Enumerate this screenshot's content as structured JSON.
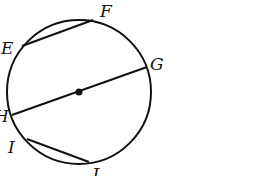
{
  "diagram": {
    "type": "circle-chords",
    "center": {
      "x": 79,
      "y": 92,
      "label": ""
    },
    "radius": 72,
    "stroke_color": "#111111",
    "points": {
      "E": {
        "x": 22,
        "y": 46
      },
      "F": {
        "x": 93,
        "y": 20
      },
      "G": {
        "x": 147,
        "y": 67
      },
      "H": {
        "x": 12,
        "y": 115
      },
      "I": {
        "x": 27,
        "y": 139
      },
      "J": {
        "x": 89,
        "y": 162
      }
    },
    "labels": {
      "E": "E",
      "F": "F",
      "G": "G",
      "H": "H",
      "I": "I",
      "J": "J"
    },
    "segments": [
      {
        "from": "E",
        "to": "F",
        "kind": "chord"
      },
      {
        "from": "H",
        "to": "G",
        "kind": "diameter"
      },
      {
        "from": "I",
        "to": "J",
        "kind": "chord"
      }
    ]
  }
}
